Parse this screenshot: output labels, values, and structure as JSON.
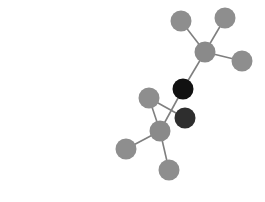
{
  "image": {
    "description": "Ball-and-stick molecular model",
    "width": 265,
    "height": 202,
    "background": "#ffffff"
  },
  "colors": {
    "bond": "#7f7f7f",
    "gray_atom": "#8c8c8c",
    "black_atom": "#111111",
    "dark_atom": "#2e2e2e"
  },
  "atoms": [
    {
      "id": "h1",
      "x": 181,
      "y": 21,
      "r": 10.5,
      "color": "#8e8e8e"
    },
    {
      "id": "h2",
      "x": 225,
      "y": 18,
      "r": 10.5,
      "color": "#8e8e8e"
    },
    {
      "id": "c1",
      "x": 205,
      "y": 52,
      "r": 10.5,
      "color": "#8a8a8a"
    },
    {
      "id": "h3",
      "x": 242,
      "y": 61,
      "r": 10.5,
      "color": "#8e8e8e"
    },
    {
      "id": "o1",
      "x": 183,
      "y": 89,
      "r": 10.5,
      "color": "#111111"
    },
    {
      "id": "o2",
      "x": 185,
      "y": 118,
      "r": 10.5,
      "color": "#2e2e2e"
    },
    {
      "id": "h4",
      "x": 149,
      "y": 98,
      "r": 10.5,
      "color": "#8e8e8e"
    },
    {
      "id": "c2",
      "x": 160,
      "y": 131,
      "r": 10.5,
      "color": "#8a8a8a"
    },
    {
      "id": "h5",
      "x": 126,
      "y": 149,
      "r": 10.5,
      "color": "#8e8e8e"
    },
    {
      "id": "h6",
      "x": 169,
      "y": 170,
      "r": 10.5,
      "color": "#8e8e8e"
    }
  ],
  "bonds": [
    [
      "h1",
      "c1"
    ],
    [
      "h2",
      "c1"
    ],
    [
      "h3",
      "c1"
    ],
    [
      "c1",
      "o1"
    ],
    [
      "o1",
      "c2"
    ],
    [
      "h4",
      "o2"
    ],
    [
      "h4",
      "c2"
    ],
    [
      "c2",
      "h5"
    ],
    [
      "c2",
      "h6"
    ]
  ]
}
